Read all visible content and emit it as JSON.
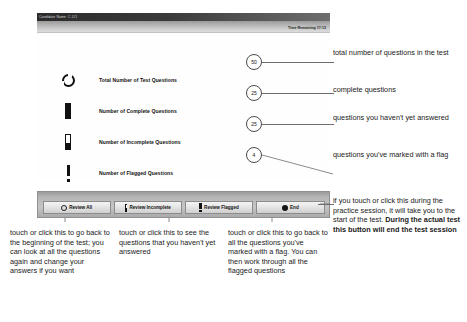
{
  "screen": {
    "title_bar": {
      "text": "Candidate Name: C J#1"
    },
    "sub_bar": {
      "time_remaining": "Time Remaining 17:13"
    },
    "legend": {
      "rows": [
        {
          "icon": "ring-icon",
          "label": "Total Number of Test Questions",
          "count": "50"
        },
        {
          "icon": "filled-bar-icon",
          "label": "Number of Complete Questions",
          "count": "25"
        },
        {
          "icon": "half-filled-bar-icon",
          "label": "Number of Incomplete Questions",
          "count": "25"
        },
        {
          "icon": "exclamation-icon",
          "label": "Number of Flagged Questions",
          "count": "4"
        }
      ]
    },
    "buttons": [
      {
        "icon": "ring-icon",
        "label": "Review All"
      },
      {
        "icon": "half-filled-bar-icon",
        "label": "Review Incomplete"
      },
      {
        "icon": "exclamation-icon",
        "label": "Review Flagged"
      },
      {
        "icon": "filled-dot-icon",
        "label": "End"
      }
    ]
  },
  "annotations": {
    "right": {
      "total": "total number of questions in the test",
      "complete": "complete questions",
      "incomplete": "questions you haven't yet answered",
      "flagged": "questions you've marked with a flag",
      "end_plain": "if you touch or click this during the practice session, it will take you to the start of the test. ",
      "end_bold": "During the actual test this button will end the test session"
    },
    "bottom": {
      "review_all": "touch or click this to go back to the beginning of the test; you can look at all the questions again and change your answers if you want",
      "review_incomplete": "touch or click this to see the questions that you haven't yet answered",
      "review_flagged": "touch or click this to go back to all the questions you've marked with a flag. You can then work through all the flagged questions"
    }
  },
  "colors": {
    "ink": "#1a1a1a",
    "leader": "#6d6d6d",
    "titlebar_dark": "#2b2b2b",
    "bar_gray": "#b5b5b5"
  }
}
